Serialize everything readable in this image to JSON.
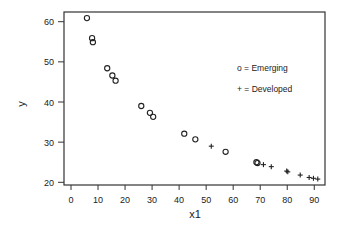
{
  "chart_data": {
    "type": "scatter",
    "title": "",
    "xlabel": "x1",
    "ylabel": "y",
    "xlim": [
      -2,
      95
    ],
    "ylim": [
      18.3,
      62.5
    ],
    "xticks": [
      0,
      10,
      20,
      30,
      40,
      50,
      60,
      70,
      80,
      90
    ],
    "yticks": [
      20,
      30,
      40,
      50,
      60
    ],
    "grid": false,
    "legend": {
      "position": "upper right (inside plot)",
      "entries": [
        {
          "symbol": "o",
          "label": "o = Emerging"
        },
        {
          "symbol": "+",
          "label": "+ = Developed"
        }
      ]
    },
    "series": [
      {
        "name": "Emerging",
        "marker": "o",
        "points": [
          {
            "x": 5.9,
            "y": 60.9
          },
          {
            "x": 7.8,
            "y": 55.9
          },
          {
            "x": 8.1,
            "y": 54.9
          },
          {
            "x": 13.4,
            "y": 48.4
          },
          {
            "x": 15.3,
            "y": 46.6
          },
          {
            "x": 16.5,
            "y": 45.3
          },
          {
            "x": 26.0,
            "y": 39.0
          },
          {
            "x": 29.2,
            "y": 37.3
          },
          {
            "x": 30.4,
            "y": 36.3
          },
          {
            "x": 41.9,
            "y": 32.1
          },
          {
            "x": 46.0,
            "y": 30.7
          },
          {
            "x": 57.2,
            "y": 27.6
          },
          {
            "x": 68.6,
            "y": 25.0
          },
          {
            "x": 69.0,
            "y": 24.8
          }
        ]
      },
      {
        "name": "Developed",
        "marker": "+",
        "points": [
          {
            "x": 51.9,
            "y": 29.0
          },
          {
            "x": 71.2,
            "y": 24.4
          },
          {
            "x": 74.1,
            "y": 23.9
          },
          {
            "x": 79.8,
            "y": 22.8
          },
          {
            "x": 80.2,
            "y": 22.6
          },
          {
            "x": 84.8,
            "y": 21.8
          },
          {
            "x": 88.1,
            "y": 21.2
          },
          {
            "x": 89.7,
            "y": 21.0
          },
          {
            "x": 91.3,
            "y": 20.8
          }
        ]
      }
    ]
  }
}
